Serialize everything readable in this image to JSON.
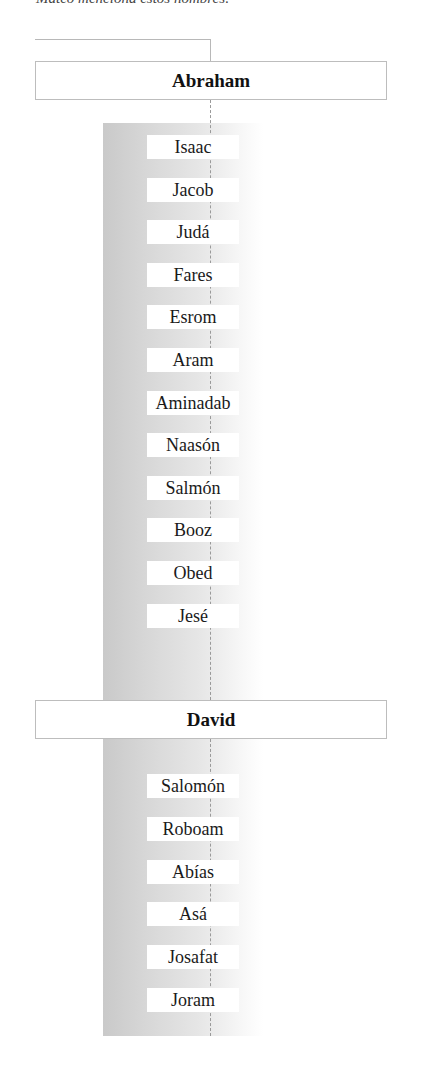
{
  "intro_text": "Mateo menciona estos nombres:",
  "genealogy": {
    "groups": [
      {
        "head": "Abraham",
        "descendants": [
          "Isaac",
          "Jacob",
          "Judá",
          "Fares",
          "Esrom",
          "Aram",
          "Aminadab",
          "Naasón",
          "Salmón",
          "Booz",
          "Obed",
          "Jesé"
        ]
      },
      {
        "head": "David",
        "descendants": [
          "Salomón",
          "Roboam",
          "Abías",
          "Asá",
          "Josafat",
          "Joram"
        ]
      }
    ]
  },
  "colors": {
    "box_border": "#bdbdbd",
    "gradient_dark": "#c9c9c9",
    "connector_line": "#9a9a9a"
  }
}
